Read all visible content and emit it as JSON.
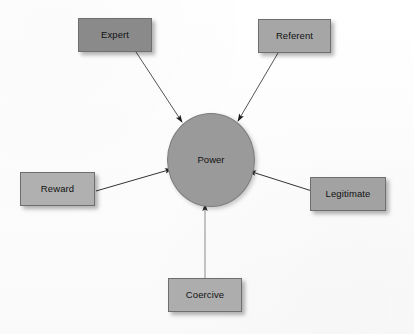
{
  "diagram": {
    "background_color": "#fdfdfd",
    "center": {
      "id": "power",
      "label": "Power",
      "shape": "circle",
      "fill_color": "#9a9a9a",
      "stroke_color": "#7d7d7d",
      "cx": 210,
      "cy": 159,
      "rx": 43,
      "ry": 46
    },
    "nodes": [
      {
        "id": "expert",
        "label": "Expert",
        "shape": "rectangle",
        "fill_color": "#8a8a8a",
        "stroke_color": "#6e6e6e",
        "x": 78,
        "y": 18,
        "width": 74,
        "height": 34,
        "position": "top-left"
      },
      {
        "id": "referent",
        "label": "Referent",
        "shape": "rectangle",
        "fill_color": "#a6a6a6",
        "stroke_color": "#6e6e6e",
        "x": 258,
        "y": 19,
        "width": 73,
        "height": 34,
        "position": "top-right"
      },
      {
        "id": "reward",
        "label": "Reward",
        "shape": "rectangle",
        "fill_color": "#b0b0b0",
        "stroke_color": "#6e6e6e",
        "x": 20,
        "y": 172,
        "width": 75,
        "height": 34,
        "position": "left"
      },
      {
        "id": "legitimate",
        "label": "Legitimate",
        "shape": "rectangle",
        "fill_color": "#a2a2a2",
        "stroke_color": "#6e6e6e",
        "x": 310,
        "y": 177,
        "width": 76,
        "height": 34,
        "position": "right"
      },
      {
        "id": "coercive",
        "label": "Coercive",
        "shape": "rectangle",
        "fill_color": "#adadad",
        "stroke_color": "#6e6e6e",
        "x": 168,
        "y": 278,
        "width": 74,
        "height": 34,
        "position": "bottom"
      }
    ],
    "edges": [
      {
        "id": "expert-to-power",
        "from": "expert",
        "to": "power",
        "x1": 136,
        "y1": 52,
        "x2": 182,
        "y2": 122,
        "arrowhead": "filled-triangle",
        "color": "#555555"
      },
      {
        "id": "referent-to-power",
        "from": "referent",
        "to": "power",
        "x1": 278,
        "y1": 53,
        "x2": 238,
        "y2": 121,
        "arrowhead": "filled-triangle",
        "color": "#555555"
      },
      {
        "id": "reward-to-power",
        "from": "reward",
        "to": "power",
        "x1": 96,
        "y1": 191,
        "x2": 172,
        "y2": 169,
        "arrowhead": "filled-triangle",
        "color": "#333333"
      },
      {
        "id": "legitimate-to-power",
        "from": "legitimate",
        "to": "power",
        "x1": 312,
        "y1": 191,
        "x2": 249,
        "y2": 171,
        "arrowhead": "filled-triangle",
        "color": "#333333"
      },
      {
        "id": "coercive-to-power",
        "from": "coercive",
        "to": "power",
        "x1": 205,
        "y1": 278,
        "x2": 205,
        "y2": 204,
        "arrowhead": "filled-triangle",
        "color": "#666666"
      }
    ]
  }
}
